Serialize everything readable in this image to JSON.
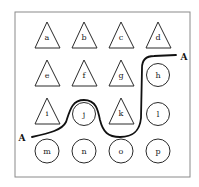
{
  "diagram": {
    "path_label_start": "A",
    "path_label_end": "A",
    "colors": {
      "stroke": "#2a2a2a",
      "frame": "#8a8a8a",
      "path": "#111111"
    },
    "shapes": [
      {
        "id": "a",
        "type": "triangle"
      },
      {
        "id": "b",
        "type": "triangle"
      },
      {
        "id": "c",
        "type": "triangle"
      },
      {
        "id": "d",
        "type": "triangle"
      },
      {
        "id": "e",
        "type": "triangle"
      },
      {
        "id": "f",
        "type": "triangle"
      },
      {
        "id": "g",
        "type": "triangle"
      },
      {
        "id": "h",
        "type": "circle"
      },
      {
        "id": "i",
        "type": "triangle"
      },
      {
        "id": "j",
        "type": "circle"
      },
      {
        "id": "k",
        "type": "triangle"
      },
      {
        "id": "l",
        "type": "circle"
      },
      {
        "id": "m",
        "type": "circle"
      },
      {
        "id": "n",
        "type": "circle"
      },
      {
        "id": "o",
        "type": "circle"
      },
      {
        "id": "p",
        "type": "circle"
      }
    ]
  }
}
